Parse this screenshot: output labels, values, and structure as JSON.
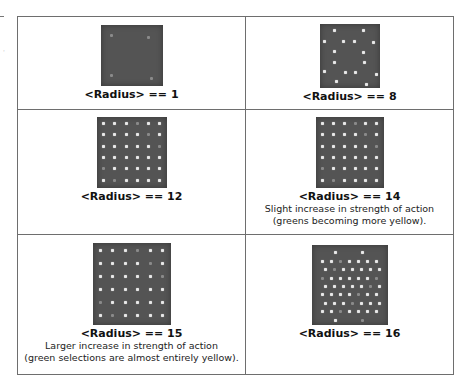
{
  "table": {
    "cells": [
      {
        "label": "<Radius> == 1",
        "caption_lines": [],
        "image": {
          "description": "dark grey field with very faint spots",
          "width": 62,
          "height": 61,
          "top": 8
        }
      },
      {
        "label": "<Radius> == 8",
        "caption_lines": [],
        "image": {
          "description": "dark grey field with sparse bright spots in ring pattern",
          "width": 60,
          "height": 64,
          "top": 7
        }
      },
      {
        "label": "<Radius> == 12",
        "caption_lines": [],
        "image": {
          "description": "dark grey field with 6x6 grid of bright spots",
          "width": 70,
          "height": 71,
          "top": 7
        }
      },
      {
        "label": "<Radius> == 14",
        "caption_lines": [
          "Slight increase in strength of action",
          "(greens becoming more yellow)."
        ],
        "image": {
          "description": "dark grey field with 6x6 grid of bright spots",
          "width": 68,
          "height": 71,
          "top": 7
        }
      },
      {
        "label": "<Radius> == 15",
        "caption_lines": [
          "Larger increase in strength of action",
          "(green selections are almost entirely yellow)."
        ],
        "image": {
          "description": "dark grey field with 6x6 grid of bright spots, larger",
          "width": 78,
          "height": 82,
          "top": 8
        }
      },
      {
        "label": "<Radius> == 16",
        "caption_lines": [],
        "image": {
          "description": "dark grey field with dense offset grid of bright spots",
          "width": 76,
          "height": 80,
          "top": 10
        }
      }
    ]
  },
  "colors": {
    "border": "#6e6e6e",
    "thumb_background": "#545454",
    "spot": "#e8e8e8"
  }
}
